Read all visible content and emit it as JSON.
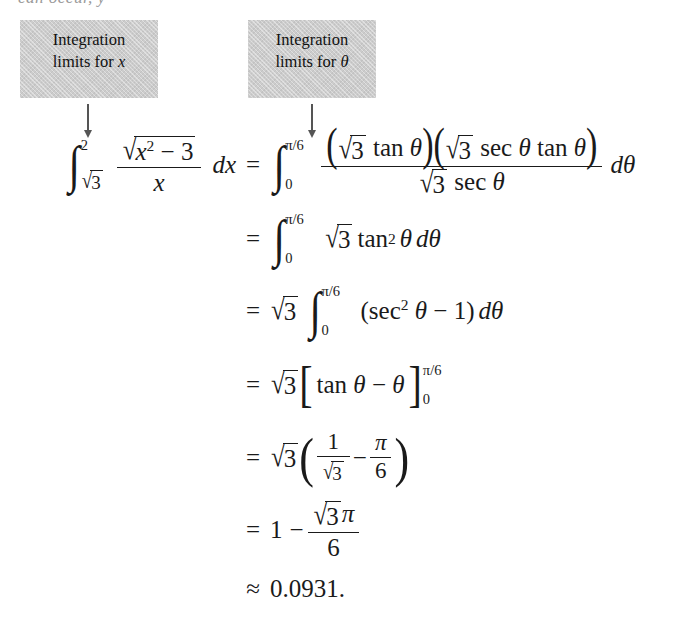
{
  "page": {
    "background_color": "#ffffff",
    "text_color": "#1a1a1a",
    "clipped_top_line": "can occur, y"
  },
  "callouts": [
    {
      "id": "integration-limits-x",
      "line1": "Integration",
      "line2_prefix": "limits for ",
      "line2_variable": "x",
      "background_color": "#cccccc",
      "arrow": "down-arrow"
    },
    {
      "id": "integration-limits-theta",
      "line1": "Integration",
      "line2_prefix": "limits for ",
      "line2_variable": "θ",
      "background_color": "#cccccc",
      "arrow": "down-arrow"
    }
  ],
  "equation": {
    "lines": [
      {
        "relation": "=",
        "lhs_plain": "∫_{√3}^{2} (√(x² − 3) / x) dx",
        "rhs_plain": "∫_{0}^{π/6} [ (√3 tan θ)(√3 sec θ tan θ) / (√3 sec θ) ] dθ",
        "lower_limit_lhs": "√3",
        "upper_limit_lhs": "2",
        "lower_limit_rhs": "0",
        "upper_limit_rhs": "π/6",
        "numerator_radicand": "3",
        "denominator_radicand": "3",
        "integrand_numerator_radicand": "x² − 3",
        "differential_lhs": "dx",
        "differential_rhs": "dθ"
      },
      {
        "relation": "=",
        "rhs_plain": "∫_{0}^{π/6} √3 tan² θ dθ",
        "lower_limit": "0",
        "upper_limit": "π/6",
        "radicand": "3",
        "function": "tan",
        "exponent": "2",
        "variable": "θ",
        "differential": "dθ"
      },
      {
        "relation": "=",
        "rhs_plain": "√3 ∫_{0}^{π/6} (sec² θ − 1) dθ",
        "coefficient_radicand": "3",
        "lower_limit": "0",
        "upper_limit": "π/6",
        "function": "sec",
        "exponent": "2",
        "variable": "θ",
        "minus_term": "1",
        "differential": "dθ"
      },
      {
        "relation": "=",
        "rhs_plain": "√3 [ tan θ − θ ]_{0}^{π/6}",
        "coefficient_radicand": "3",
        "function": "tan",
        "variable": "θ",
        "minus_term": "θ",
        "eval_lower": "0",
        "eval_upper": "π/6"
      },
      {
        "relation": "=",
        "rhs_plain": "√3 ( 1/√3 − π/6 )",
        "coefficient_radicand": "3",
        "frac1_numerator": "1",
        "frac1_denominator_radicand": "3",
        "frac2_numerator": "π",
        "frac2_denominator": "6"
      },
      {
        "relation": "=",
        "rhs_plain": "1 − √3 π / 6",
        "leading_term": "1",
        "frac_numerator_radicand": "3",
        "frac_numerator_symbol": "π",
        "frac_denominator": "6"
      },
      {
        "relation": "≈",
        "rhs_plain": "0.0931.",
        "value": "0.0931",
        "terminator": "."
      }
    ],
    "symbols": {
      "integral": "∫",
      "radical": "√",
      "theta": "θ",
      "pi": "π",
      "minus": "−",
      "approx": "≈",
      "equals": "="
    }
  }
}
